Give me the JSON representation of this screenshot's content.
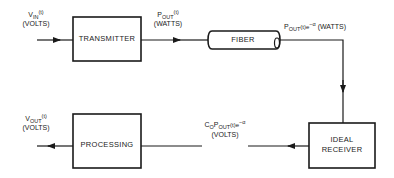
{
  "blocks": {
    "transmitter": "TRANSMITTER",
    "fiber": "FIBER",
    "receiver_line1": "IDEAL",
    "receiver_line2": "RECEIVER",
    "processing": "PROCESSING"
  },
  "signals": {
    "input": {
      "symbol": "V",
      "subscript": "IN",
      "arg": "(t)",
      "unit": "(VOLTS)"
    },
    "tx_output": {
      "symbol": "P",
      "subscript": "OUT",
      "arg": "(t)",
      "unit": "(WATTS)"
    },
    "fiber_output": {
      "symbol": "P",
      "subscript": "OUT",
      "arg": "(t)e",
      "exponent": "−α",
      "unit": "(WATTS)"
    },
    "receiver_output": {
      "prefix": "C",
      "prefix_sub": "O",
      "symbol": "P",
      "subscript": "OUT",
      "arg": "(t)e",
      "exponent": "−α",
      "unit": "(VOLTS)"
    },
    "output": {
      "symbol": "V",
      "subscript": "OUT",
      "arg": "(t)",
      "unit": "(VOLTS)"
    }
  }
}
